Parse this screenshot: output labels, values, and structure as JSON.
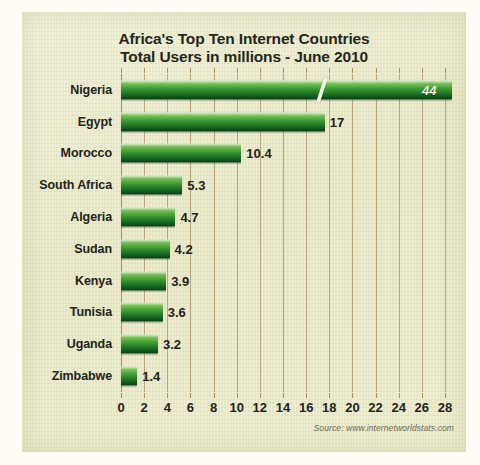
{
  "chart_data": {
    "type": "bar",
    "orientation": "horizontal",
    "title": "Africa's Top Ten Internet Countries\nTotal Users in millions - June 2010",
    "title_lines": [
      "Africa's Top Ten Internet Countries",
      "Total Users in millions - June 2010"
    ],
    "categories": [
      "Nigeria",
      "Egypt",
      "Morocco",
      "South Africa",
      "Algeria",
      "Sudan",
      "Kenya",
      "Tunisia",
      "Uganda",
      "Zimbabwe"
    ],
    "values": [
      44,
      17,
      10.4,
      5.3,
      4.7,
      4.2,
      3.9,
      3.6,
      3.2,
      1.4
    ],
    "value_labels": [
      "44",
      "17",
      "10.4",
      "5.3",
      "4.7",
      "4.2",
      "3.9",
      "3.6",
      "3.2",
      "1.4"
    ],
    "bars": [
      {
        "category": "Nigeria",
        "value": 44,
        "label": "44",
        "plot_value": 28.6,
        "label_inside": true,
        "broken_axis": true,
        "break_at": 17.2
      },
      {
        "category": "Egypt",
        "value": 17,
        "label": "17",
        "plot_value": 17.6,
        "label_inside": false,
        "broken_axis": false
      },
      {
        "category": "Morocco",
        "value": 10.4,
        "label": "10.4",
        "plot_value": 10.4,
        "label_inside": false,
        "broken_axis": false
      },
      {
        "category": "South Africa",
        "value": 5.3,
        "label": "5.3",
        "plot_value": 5.3,
        "label_inside": false,
        "broken_axis": false
      },
      {
        "category": "Algeria",
        "value": 4.7,
        "label": "4.7",
        "plot_value": 4.7,
        "label_inside": false,
        "broken_axis": false
      },
      {
        "category": "Sudan",
        "value": 4.2,
        "label": "4.2",
        "plot_value": 4.2,
        "label_inside": false,
        "broken_axis": false
      },
      {
        "category": "Kenya",
        "value": 3.9,
        "label": "3.9",
        "plot_value": 3.9,
        "label_inside": false,
        "broken_axis": false
      },
      {
        "category": "Tunisia",
        "value": 3.6,
        "label": "3.6",
        "plot_value": 3.6,
        "label_inside": false,
        "broken_axis": false
      },
      {
        "category": "Uganda",
        "value": 3.2,
        "label": "3.2",
        "plot_value": 3.2,
        "label_inside": false,
        "broken_axis": false
      },
      {
        "category": "Zimbabwe",
        "value": 1.4,
        "label": "1.4",
        "plot_value": 1.4,
        "label_inside": false,
        "broken_axis": false
      }
    ],
    "xlabel": "",
    "ylabel": "",
    "xlim": [
      0,
      28
    ],
    "xticks": [
      0,
      2,
      4,
      6,
      8,
      10,
      12,
      14,
      16,
      18,
      20,
      22,
      24,
      26,
      28
    ],
    "xtick_labels": [
      "0",
      "2",
      "4",
      "6",
      "8",
      "10",
      "12",
      "14",
      "16",
      "18",
      "20",
      "22",
      "24",
      "26",
      "28"
    ],
    "grid": true,
    "grid_orientation": "vertical",
    "legend": false,
    "units": "millions of users",
    "note": "Nigeria bar is truncated with an axis-break slash; its true value 44 exceeds the 0-28 axis."
  },
  "source": {
    "text": "Source: www.internetworldstats.com"
  },
  "colors": {
    "panel_background": "#e9e9c9",
    "bar_light": "#b9dca0",
    "bar_mid": "#3f9c34",
    "bar_dark": "#0a3b12",
    "gridline": "#b09a72",
    "text": "#23231a",
    "inside_label": "#f4f4ea",
    "source_text": "#6d6b52"
  }
}
